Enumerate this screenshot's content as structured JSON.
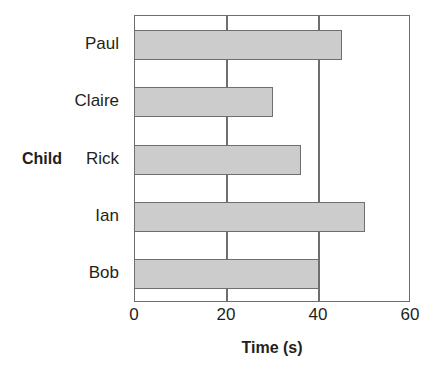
{
  "chart_data": {
    "type": "bar",
    "orientation": "horizontal",
    "title": "",
    "xlabel": "Time (s)",
    "ylabel": "Child",
    "categories": [
      "Paul",
      "Claire",
      "Rick",
      "Ian",
      "Bob"
    ],
    "values": [
      45,
      30,
      36,
      50,
      40
    ],
    "series": [
      {
        "name": "Time (s)",
        "values": [
          45,
          30,
          36,
          50,
          40
        ]
      }
    ],
    "xlim": [
      0,
      60
    ],
    "xticks": [
      0,
      20,
      40,
      60
    ],
    "xtick_labels": [
      "0",
      "20",
      "40",
      "60"
    ],
    "grid": "vertical-only",
    "legend": "none",
    "bar_fill_color": "#cccccc",
    "bar_edge_color": "#6d6e71",
    "axis_color": "#6d6e71",
    "background_color": "#ffffff",
    "text_color": "#231f20"
  },
  "axes": {
    "x_title": "Time (s)",
    "y_title": "Child"
  }
}
